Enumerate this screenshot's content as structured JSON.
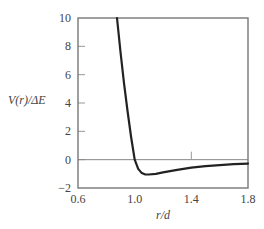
{
  "chart_data": {
    "type": "line",
    "title": "",
    "xlabel": "r/d",
    "ylabel": "V(r)/ΔE",
    "xlim": [
      0.6,
      1.8
    ],
    "ylim": [
      -2,
      10
    ],
    "xticks": [
      0.6,
      1.0,
      1.4,
      1.8
    ],
    "xtick_labels": [
      "0.6",
      "1.0",
      "1.4",
      "1.8"
    ],
    "yticks": [
      -2,
      0,
      2,
      4,
      6,
      8,
      10
    ],
    "ytick_labels": [
      "−2",
      "0",
      "2",
      "4",
      "6",
      "8",
      "10"
    ],
    "grid": false,
    "legend": null,
    "reference_lines": [
      {
        "axis": "y",
        "value": 0
      }
    ],
    "annotations": [
      {
        "type": "tick-mark",
        "x": 1.4,
        "y": 0,
        "note": "small vertical mark above zero line"
      }
    ],
    "series": [
      {
        "name": "V(r)/ΔE",
        "x": [
          0.875,
          0.9,
          0.925,
          0.95,
          0.975,
          1.0,
          1.025,
          1.05,
          1.075,
          1.1,
          1.15,
          1.2,
          1.3,
          1.4,
          1.5,
          1.6,
          1.7,
          1.8
        ],
        "y": [
          10.0,
          7.6,
          5.4,
          3.4,
          1.6,
          0.0,
          -0.65,
          -0.95,
          -1.05,
          -1.05,
          -1.0,
          -0.9,
          -0.72,
          -0.57,
          -0.46,
          -0.38,
          -0.32,
          -0.28
        ]
      }
    ]
  },
  "colors": {
    "curve": "#222222",
    "frame": "#777777",
    "zero_line": "#888888",
    "text": "#444444"
  }
}
